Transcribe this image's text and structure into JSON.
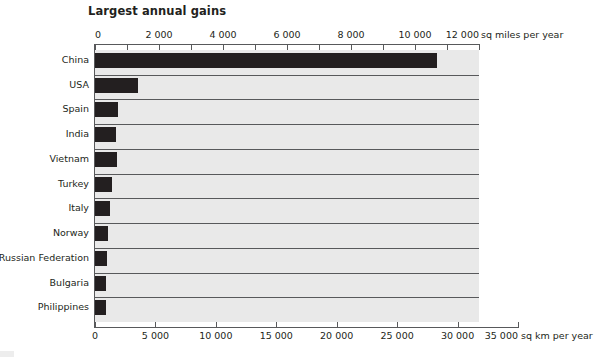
{
  "chart_data": {
    "type": "bar",
    "orientation": "horizontal",
    "title": "Largest annual gains",
    "categories": [
      "China",
      "USA",
      "Spain",
      "India",
      "Vietnam",
      "Turkey",
      "Italy",
      "Norway",
      "Russian Federation",
      "Bulgaria",
      "Philippines"
    ],
    "values_sq_miles": [
      10700,
      1340,
      720,
      660,
      680,
      530,
      470,
      410,
      375,
      350,
      345
    ],
    "values_sq_km": [
      27700,
      3470,
      1870,
      1710,
      1760,
      1370,
      1220,
      1060,
      970,
      905,
      895
    ],
    "unit_primary": "sq miles per year",
    "unit_secondary": "sq km per year",
    "xlabel_top": "sq miles per year",
    "xlabel_bottom": "sq km per year",
    "ylabel": "",
    "xlim_top": [
      0,
      12000
    ],
    "xlim_bottom": [
      0,
      31046
    ],
    "grid": true,
    "legend": "none",
    "bar_color": "#231f20",
    "plot_background": "#e9e9e9",
    "axis_color": "#58595b",
    "top_axis": {
      "labels": [
        "0",
        "2 000",
        "4 000",
        "6 000",
        "8 000",
        "10 000",
        "12 000"
      ],
      "label_values": [
        0,
        2000,
        4000,
        6000,
        8000,
        10000,
        12000
      ],
      "minor_step": 1000,
      "unit_label": "sq miles per year"
    },
    "bottom_axis": {
      "labels": [
        "0",
        "5 000",
        "10 000",
        "15 000",
        "20 000",
        "25 000",
        "30 000",
        "35 000"
      ],
      "label_values": [
        0,
        5000,
        10000,
        15000,
        20000,
        25000,
        30000,
        35000
      ],
      "unit_label": "sq km per year"
    },
    "bars": [
      {
        "label": "China",
        "sq_miles": 10700,
        "sq_km": 27700
      },
      {
        "label": "USA",
        "sq_miles": 1340,
        "sq_km": 3470
      },
      {
        "label": "Spain",
        "sq_miles": 720,
        "sq_km": 1870
      },
      {
        "label": "India",
        "sq_miles": 660,
        "sq_km": 1710
      },
      {
        "label": "Vietnam",
        "sq_miles": 680,
        "sq_km": 1760
      },
      {
        "label": "Turkey",
        "sq_miles": 530,
        "sq_km": 1370
      },
      {
        "label": "Italy",
        "sq_miles": 470,
        "sq_km": 1220
      },
      {
        "label": "Norway",
        "sq_miles": 410,
        "sq_km": 1060
      },
      {
        "label": "Russian Federation",
        "sq_miles": 375,
        "sq_km": 970
      },
      {
        "label": "Bulgaria",
        "sq_miles": 350,
        "sq_km": 905
      },
      {
        "label": "Philippines",
        "sq_miles": 345,
        "sq_km": 895
      }
    ]
  }
}
